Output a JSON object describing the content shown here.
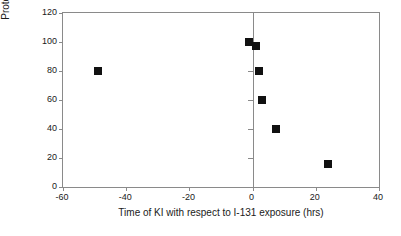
{
  "chart_data": {
    "type": "scatter",
    "title": "",
    "xlabel": "Time of KI with respect to I-131 exposure (hrs)",
    "ylabel": "Protection afforded (% control)",
    "xlim": [
      -60,
      40
    ],
    "ylim": [
      0,
      120
    ],
    "xticks": [
      -60,
      -40,
      -20,
      0,
      20,
      40
    ],
    "xtick_labels": [
      "-60",
      "-40",
      "-20",
      "0",
      "20",
      "40"
    ],
    "yticks": [
      0,
      20,
      40,
      60,
      80,
      100,
      120
    ],
    "ytick_labels": [
      "0",
      "20",
      "40",
      "60",
      "80",
      "100",
      "120"
    ],
    "grid": false,
    "legend": false,
    "marker_style": "filled-square",
    "marker_color": "#111111",
    "frame_color": "#8a8a8a",
    "reference_lines": [
      {
        "axis": "x",
        "value": 0,
        "color": "#8a8a8a"
      }
    ],
    "series": [
      {
        "name": "Protection afforded",
        "points": [
          {
            "x": -49,
            "y": 80
          },
          {
            "x": -1,
            "y": 100
          },
          {
            "x": 1,
            "y": 97
          },
          {
            "x": 2,
            "y": 80
          },
          {
            "x": 3,
            "y": 60
          },
          {
            "x": 7.5,
            "y": 40
          },
          {
            "x": 24,
            "y": 16
          }
        ]
      }
    ]
  }
}
